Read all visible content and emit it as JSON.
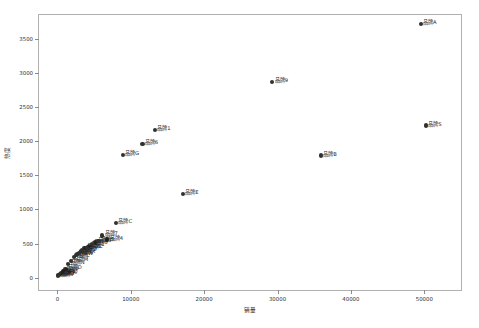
{
  "chart_data": {
    "type": "scatter",
    "title": "",
    "xlabel": "销量",
    "ylabel": "热度",
    "xlim": [
      -2500,
      55000
    ],
    "ylim": [
      -180,
      3850
    ],
    "grid": false,
    "legend": null,
    "xticks": [
      0,
      10000,
      20000,
      30000,
      40000,
      50000
    ],
    "xtick_labels": [
      "0",
      "10000",
      "20000",
      "30000",
      "40000",
      "50000"
    ],
    "yticks": [
      0,
      500,
      1000,
      1500,
      2000,
      2500,
      3000,
      3500
    ],
    "ytick_labels": [
      "0",
      "500",
      "1000",
      "1500",
      "2000",
      "2500",
      "3000",
      "3500"
    ],
    "marker_color": "#303030",
    "points": [
      {
        "label": "品牌A",
        "x": 49500,
        "y": 3720
      },
      {
        "label": "品牌S",
        "x": 50200,
        "y": 2230
      },
      {
        "label": "品牌9",
        "x": 29300,
        "y": 2870
      },
      {
        "label": "品牌B",
        "x": 35900,
        "y": 1790
      },
      {
        "label": "品牌1",
        "x": 13300,
        "y": 2170
      },
      {
        "label": "品牌6",
        "x": 11600,
        "y": 1960
      },
      {
        "label": "品牌G",
        "x": 8900,
        "y": 1800
      },
      {
        "label": "品牌E",
        "x": 17100,
        "y": 1230
      },
      {
        "label": "品牌C",
        "x": 8000,
        "y": 800
      },
      {
        "label": "品牌7",
        "x": 6100,
        "y": 620
      },
      {
        "label": "品牌4",
        "x": 6800,
        "y": 560
      },
      {
        "label": "品牌3",
        "x": 5200,
        "y": 520
      },
      {
        "label": "品牌1",
        "x": 4300,
        "y": 470
      },
      {
        "label": "品牌8",
        "x": 3700,
        "y": 430
      },
      {
        "label": "品牌2",
        "x": 3200,
        "y": 390
      },
      {
        "label": "品牌K",
        "x": 2700,
        "y": 350
      },
      {
        "label": "品牌L",
        "x": 2300,
        "y": 300
      },
      {
        "label": "品牌M",
        "x": 1900,
        "y": 250
      },
      {
        "label": "品牌N",
        "x": 1500,
        "y": 200
      },
      {
        "label": "品牌D",
        "x": 1100,
        "y": 130
      },
      {
        "label": "品牌P",
        "x": 800,
        "y": 95
      },
      {
        "label": "品牌Q",
        "x": 520,
        "y": 70
      },
      {
        "label": "品牌R",
        "x": 330,
        "y": 55
      },
      {
        "label": "品牌T",
        "x": 200,
        "y": 45
      },
      {
        "label": "品牌U",
        "x": 120,
        "y": 38
      },
      {
        "label": "品牌V",
        "x": 70,
        "y": 30
      },
      {
        "label": "品牌W",
        "x": 2500,
        "y": 330
      },
      {
        "label": "品牌X",
        "x": 3000,
        "y": 360
      },
      {
        "label": "品牌Y",
        "x": 3400,
        "y": 400
      },
      {
        "label": "品牌Z",
        "x": 4000,
        "y": 440
      },
      {
        "label": "品牌0",
        "x": 4700,
        "y": 490
      },
      {
        "label": "品牌5",
        "x": 5600,
        "y": 540
      }
    ]
  }
}
